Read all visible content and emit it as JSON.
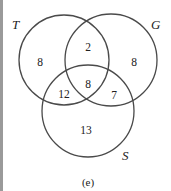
{
  "diagram": {
    "type": "venn-3",
    "caption": "(e)",
    "sets": [
      {
        "id": "T",
        "label": "T",
        "cx": 64,
        "cy": 60,
        "r": 45
      },
      {
        "id": "G",
        "label": "G",
        "cx": 111,
        "cy": 60,
        "r": 46
      },
      {
        "id": "S",
        "label": "S",
        "cx": 88,
        "cy": 111,
        "r": 46
      }
    ],
    "regions": {
      "T_only": "8",
      "T_and_G_only": "2",
      "G_only": "8",
      "T_and_G_and_S": "8",
      "T_and_S_only": "12",
      "G_and_S_only": "7",
      "S_only": "13"
    },
    "colors": {
      "stroke": "#4a4a4a",
      "text": "#222222",
      "border": "#9a9a9a"
    }
  }
}
